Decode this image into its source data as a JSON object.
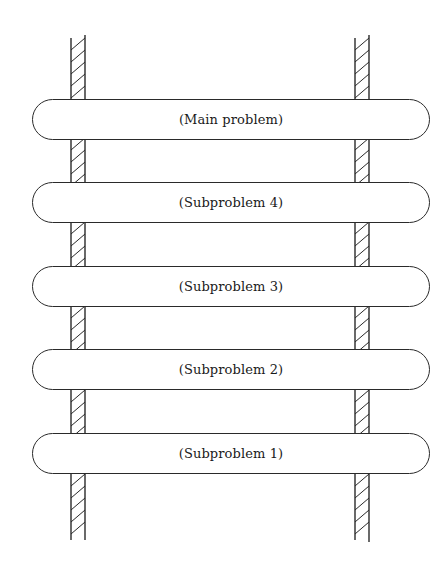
{
  "diagram": {
    "type": "ladder",
    "colors": {
      "stroke": "#2a2a2a",
      "background": "#ffffff",
      "text": "#1a1a1a"
    },
    "rungs": [
      {
        "label": "(Main problem)",
        "top": 99
      },
      {
        "label": "(Subproblem 4)",
        "top": 182
      },
      {
        "label": "(Subproblem 3)",
        "top": 266
      },
      {
        "label": "(Subproblem 2)",
        "top": 349
      },
      {
        "label": "(Subproblem 1)",
        "top": 433
      }
    ],
    "ropes": [
      {
        "side": "left"
      },
      {
        "side": "right"
      }
    ]
  }
}
